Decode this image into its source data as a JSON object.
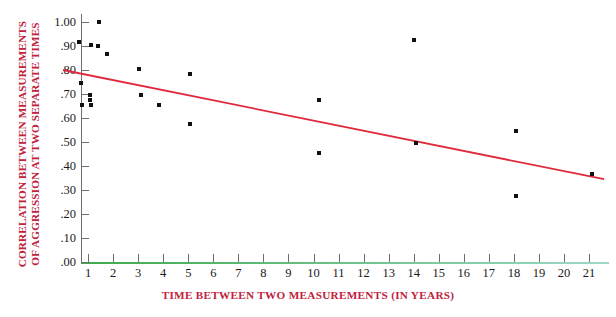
{
  "chart_data": {
    "type": "scatter",
    "title": "",
    "xlabel": "TIME BETWEEN TWO MEASUREMENTS (IN YEARS)",
    "ylabel_lines": [
      "CORRELATION BETWEEN MEASUREMENTS",
      "OF AGGRESSION AT TWO SEPARATE TIMES"
    ],
    "xlim": [
      0,
      22
    ],
    "ylim": [
      0.0,
      1.0
    ],
    "xticks": [
      1,
      2,
      3,
      4,
      5,
      6,
      7,
      8,
      9,
      10,
      11,
      12,
      13,
      14,
      15,
      16,
      17,
      18,
      19,
      20,
      21
    ],
    "xtick_labels": [
      "1",
      "2",
      "3",
      "4",
      "5",
      "6",
      "7",
      "8",
      "9",
      "10",
      "11",
      "12",
      "13",
      "14",
      "15",
      "16",
      "17",
      "18",
      "19",
      "20",
      "21"
    ],
    "yticks": [
      0.0,
      0.1,
      0.2,
      0.3,
      0.4,
      0.5,
      0.6,
      0.7,
      0.8,
      0.9,
      1.0
    ],
    "ytick_labels": [
      ".00",
      ".10",
      ".20",
      ".30",
      ".40",
      ".50",
      ".60",
      ".70",
      ".80",
      ".90",
      "1.00"
    ],
    "grid": false,
    "legend": false,
    "points": [
      {
        "x": 1.45,
        "y": 1.0
      },
      {
        "x": 0.62,
        "y": 0.915
      },
      {
        "x": 1.12,
        "y": 0.905
      },
      {
        "x": 1.38,
        "y": 0.9
      },
      {
        "x": 1.75,
        "y": 0.865
      },
      {
        "x": 0.72,
        "y": 0.745
      },
      {
        "x": 1.08,
        "y": 0.695
      },
      {
        "x": 1.08,
        "y": 0.675
      },
      {
        "x": 0.75,
        "y": 0.655
      },
      {
        "x": 1.1,
        "y": 0.655
      },
      {
        "x": 3.05,
        "y": 0.805
      },
      {
        "x": 3.1,
        "y": 0.695
      },
      {
        "x": 3.85,
        "y": 0.655
      },
      {
        "x": 5.05,
        "y": 0.785
      },
      {
        "x": 5.05,
        "y": 0.575
      },
      {
        "x": 10.2,
        "y": 0.675
      },
      {
        "x": 10.2,
        "y": 0.455
      },
      {
        "x": 14.0,
        "y": 0.925
      },
      {
        "x": 14.1,
        "y": 0.495
      },
      {
        "x": 18.1,
        "y": 0.545
      },
      {
        "x": 18.1,
        "y": 0.275
      },
      {
        "x": 21.1,
        "y": 0.365
      }
    ],
    "trendline": {
      "x_start": 0.0,
      "y_start": 0.8,
      "x_end": 21.6,
      "y_end": 0.345,
      "color": "#e02a3c"
    },
    "point_color": "#111111",
    "axis_color": "#6e6e6e",
    "xaxis_color": "#3faa4c",
    "label_color": "#c0223c"
  }
}
